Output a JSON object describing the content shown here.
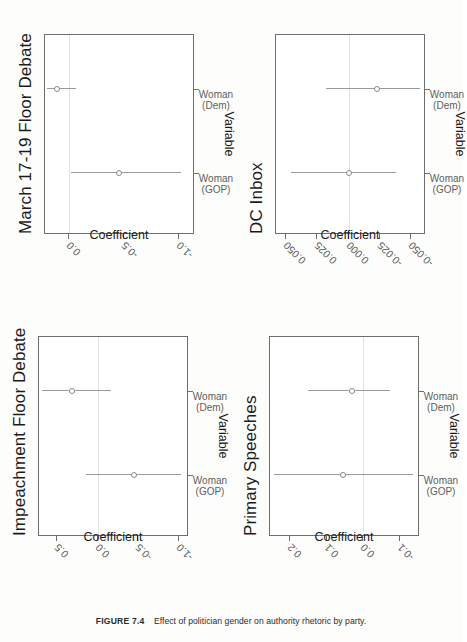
{
  "caption": {
    "figure_number": "FIGURE 7.4",
    "text": "Effect of politician gender on authority rhetoric by party."
  },
  "axis_titles": {
    "x": "Variable",
    "y": "Coefficient"
  },
  "categories": [
    "Woman (GOP)",
    "Woman (Dem)"
  ],
  "category_lines": {
    "gop_line1": "Woman",
    "gop_line2": "(GOP)",
    "dem_line1": "Woman",
    "dem_line2": "(Dem)"
  },
  "chart_data": [
    {
      "type": "scatter",
      "title": "March 17-19 Floor Debate",
      "xlabel": "Variable",
      "ylabel": "Coefficient",
      "categories": [
        "Woman (GOP)",
        "Woman (Dem)"
      ],
      "yticks": [
        "0.0",
        "-0.5",
        "-1.0"
      ],
      "ytick_values": [
        0.0,
        -0.5,
        -1.0
      ],
      "ylim": [
        -1.15,
        0.22
      ],
      "grid": false,
      "zero_reference": 0.0,
      "series": [
        {
          "name": "Woman (GOP)",
          "estimate": -0.46,
          "ci_low": -1.02,
          "ci_high": -0.02
        },
        {
          "name": "Woman (Dem)",
          "estimate": 0.11,
          "ci_low": -0.06,
          "ci_high": 0.2
        }
      ]
    },
    {
      "type": "scatter",
      "title": "DC Inbox",
      "xlabel": "Variable",
      "ylabel": "Coefficient",
      "categories": [
        "Woman (GOP)",
        "Woman (Dem)"
      ],
      "yticks": [
        "0.050",
        "0.025",
        "0.000",
        "-0.025",
        "-0.050"
      ],
      "ytick_values": [
        0.05,
        0.025,
        0.0,
        -0.025,
        -0.05
      ],
      "ylim": [
        -0.062,
        0.058
      ],
      "grid": false,
      "zero_reference": 0.0,
      "series": [
        {
          "name": "Woman (GOP)",
          "estimate": 0.0,
          "ci_low": -0.038,
          "ci_high": 0.046
        },
        {
          "name": "Woman (Dem)",
          "estimate": -0.023,
          "ci_low": -0.057,
          "ci_high": 0.018
        }
      ]
    },
    {
      "type": "scatter",
      "title": "Impeachment Floor Debate",
      "xlabel": "Variable",
      "ylabel": "Coefficient",
      "categories": [
        "Woman (GOP)",
        "Woman (Dem)"
      ],
      "yticks": [
        "0.5",
        "0.0",
        "-0.5",
        "-1.0"
      ],
      "ytick_values": [
        0.5,
        0.0,
        -0.5,
        -1.0
      ],
      "ylim": [
        -1.12,
        0.72
      ],
      "grid": false,
      "zero_reference": 0.0,
      "series": [
        {
          "name": "Woman (GOP)",
          "estimate": -0.45,
          "ci_low": -1.02,
          "ci_high": 0.14
        },
        {
          "name": "Woman (Dem)",
          "estimate": 0.32,
          "ci_low": -0.16,
          "ci_high": 0.68
        }
      ]
    },
    {
      "type": "scatter",
      "title": "Primary Speeches",
      "xlabel": "Variable",
      "ylabel": "Coefficient",
      "categories": [
        "Woman (GOP)",
        "Woman (Dem)"
      ],
      "yticks": [
        "0.2",
        "0.1",
        "0.0",
        "-0.1"
      ],
      "ytick_values": [
        0.2,
        0.1,
        0.0,
        -0.1
      ],
      "ylim": [
        -0.155,
        0.255
      ],
      "grid": false,
      "zero_reference": 0.0,
      "series": [
        {
          "name": "Woman (GOP)",
          "estimate": 0.055,
          "ci_low": -0.135,
          "ci_high": 0.245
        },
        {
          "name": "Woman (Dem)",
          "estimate": 0.03,
          "ci_low": -0.072,
          "ci_high": 0.152
        }
      ]
    }
  ],
  "panel_titles": {
    "top_left": "March 17-19 Floor Debate",
    "top_right": "DC Inbox",
    "bottom_left": "Impeachment Floor Debate",
    "bottom_right": "Primary Speeches"
  }
}
